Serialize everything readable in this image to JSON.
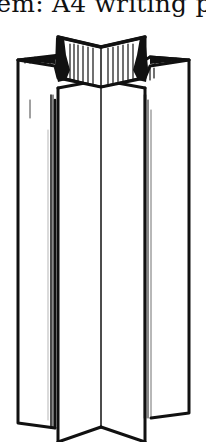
{
  "page": {
    "caption_fragment": "tem: A4 writing p",
    "figure": {
      "subject": "folded paper star column",
      "description": "Line illustration of a sheet of A4 writing paper folded into a standing six-pointed star-shaped column",
      "ink_color": "#111111",
      "paper_color": "#ffffff"
    }
  }
}
